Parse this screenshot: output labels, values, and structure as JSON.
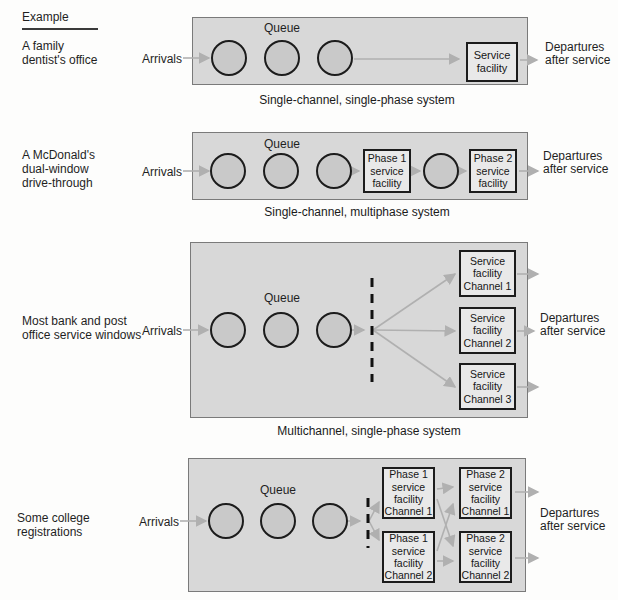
{
  "colors": {
    "panel_fill": "#d8d8d8",
    "panel_border": "#7a7a7a",
    "circle_fill": "#c9c9c9",
    "facility_fill": "#e9e9e9",
    "box_border": "#1c1c1c",
    "arrow": "#b0b0b0",
    "dashed_line": "#111111",
    "text": "#1f1f1f"
  },
  "header": {
    "label": "Example"
  },
  "shared": {
    "arrivals": "Arrivals",
    "queue": "Queue",
    "departures": [
      "Departures",
      "after service"
    ]
  },
  "diagrams": [
    {
      "example": [
        "A family",
        "dentist's office"
      ],
      "caption": "Single-channel, single-phase system",
      "facilities": [
        [
          "Service",
          "facility"
        ]
      ]
    },
    {
      "example": [
        "A McDonald's",
        "dual-window",
        "drive-through"
      ],
      "caption": "Single-channel, multiphase system",
      "facilities": [
        [
          "Phase 1",
          "service",
          "facility"
        ],
        [
          "Phase 2",
          "service",
          "facility"
        ]
      ]
    },
    {
      "example": [
        "Most bank and post",
        "office service windows"
      ],
      "caption": "Multichannel, single-phase system",
      "facilities": [
        [
          "Service",
          "facility",
          "Channel 1"
        ],
        [
          "Service",
          "facility",
          "Channel 2"
        ],
        [
          "Service",
          "facility",
          "Channel 3"
        ]
      ]
    },
    {
      "example": [
        "Some college",
        "registrations"
      ],
      "facilities": [
        [
          "Phase 1",
          "service",
          "facility",
          "Channel 1"
        ],
        [
          "Phase 2",
          "service",
          "facility",
          "Channel 1"
        ],
        [
          "Phase 1",
          "service",
          "facility",
          "Channel 2"
        ],
        [
          "Phase 2",
          "service",
          "facility",
          "Channel 2"
        ]
      ]
    }
  ]
}
